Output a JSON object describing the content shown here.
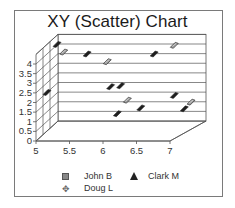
{
  "chart_data": {
    "type": "scatter",
    "title": "XY (Scatter) Chart",
    "xlabel": "",
    "ylabel": "",
    "xlim": [
      5,
      7
    ],
    "ylim": [
      0,
      4.5
    ],
    "x_ticks": [
      "5",
      "5.5",
      "6",
      "6.5",
      "7"
    ],
    "y_ticks": [
      "0",
      "0.5",
      "1",
      "1.5",
      "2",
      "2.5",
      "3",
      "3.5",
      "4"
    ],
    "grid": true,
    "style": "3d",
    "legend_position": "bottom",
    "series": [
      {
        "name": "John B",
        "marker": "square",
        "points": [
          [
            5.25,
            4.1
          ],
          [
            5.9,
            3.6
          ],
          [
            6.2,
            1.6
          ],
          [
            6.9,
            4.45
          ],
          [
            7.15,
            1.5
          ]
        ]
      },
      {
        "name": "Clark M",
        "marker": "triangle",
        "points": [
          [
            5.0,
            2.0
          ],
          [
            5.15,
            4.5
          ],
          [
            5.6,
            4.0
          ],
          [
            5.95,
            2.3
          ],
          [
            6.1,
            2.35
          ],
          [
            6.6,
            4.0
          ],
          [
            6.9,
            1.85
          ],
          [
            6.4,
            1.2
          ],
          [
            7.05,
            1.15
          ],
          [
            6.05,
            0.9
          ]
        ]
      },
      {
        "name": "Doug L",
        "marker": "cross",
        "points": []
      }
    ]
  },
  "legend": {
    "items": [
      {
        "label": "John B"
      },
      {
        "label": "Clark M"
      },
      {
        "label": "Doug L"
      }
    ]
  }
}
